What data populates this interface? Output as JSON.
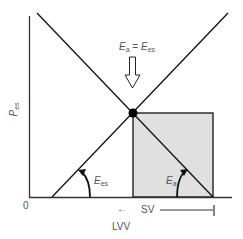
{
  "diagram": {
    "y_axis_label": {
      "main": "P",
      "sub": "es"
    },
    "origin_label": "0",
    "x_axis_label": "LVV",
    "sv_label": "SV",
    "sv_arrow_left": "←",
    "annotation": {
      "left_main": "E",
      "left_sub": "a",
      "equals": " = ",
      "right_main": "E",
      "right_sub": "es"
    },
    "slope_labels": {
      "ees": {
        "main": "E",
        "sub": "es"
      },
      "ea": {
        "main": "E",
        "sub": "a"
      }
    },
    "colors": {
      "line": "#111111",
      "box_fill": "#e0e0e0",
      "axis": "#333333",
      "text": "#555555"
    }
  }
}
